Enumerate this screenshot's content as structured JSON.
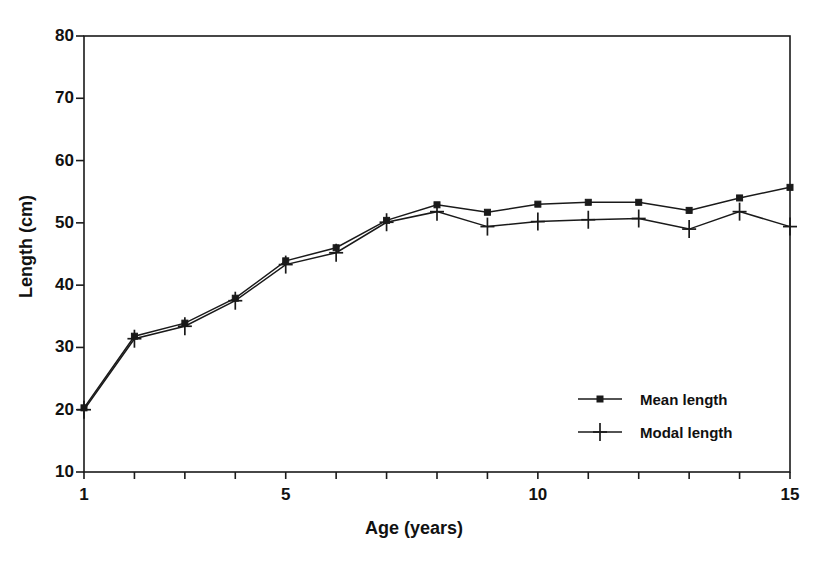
{
  "chart_data": {
    "type": "line",
    "title": "",
    "xlabel": "Age (years)",
    "ylabel": "Length (cm)",
    "xlim": [
      1,
      15
    ],
    "ylim": [
      10,
      80
    ],
    "x": [
      1,
      2,
      3,
      4,
      5,
      6,
      7,
      8,
      9,
      10,
      11,
      12,
      13,
      14,
      15
    ],
    "xticks": [
      1,
      2,
      3,
      4,
      5,
      6,
      7,
      8,
      9,
      10,
      11,
      12,
      13,
      14,
      15
    ],
    "xtick_labels": [
      "1",
      "",
      "",
      "",
      "5",
      "",
      "",
      "",
      "",
      "10",
      "",
      "",
      "",
      "",
      "15"
    ],
    "yticks": [
      10,
      20,
      30,
      40,
      50,
      60,
      70,
      80
    ],
    "ytick_labels": [
      "10",
      "20",
      "30",
      "40",
      "50",
      "60",
      "70",
      "80"
    ],
    "grid": false,
    "legend_position": "lower right",
    "series": [
      {
        "name": "Mean length",
        "marker": "square",
        "values": [
          20.3,
          31.8,
          33.9,
          37.9,
          43.9,
          46.0,
          50.4,
          52.9,
          51.7,
          53.0,
          53.3,
          53.3,
          52.0,
          54.0,
          55.7
        ]
      },
      {
        "name": "Modal length",
        "marker": "plus",
        "values": [
          20.0,
          31.4,
          33.4,
          37.5,
          43.3,
          45.2,
          50.1,
          51.8,
          49.4,
          50.2,
          50.5,
          50.7,
          49.0,
          51.8,
          49.4
        ]
      }
    ]
  },
  "axes": {
    "x_title": "Age (years)",
    "y_title": "Length (cm)"
  },
  "legend": {
    "entries": [
      {
        "label": "Mean length",
        "marker": "square"
      },
      {
        "label": "Modal length",
        "marker": "plus"
      }
    ]
  },
  "style": {
    "line_color": "#1a1a1a",
    "axis_color": "#1a1a1a",
    "background": "#ffffff"
  }
}
